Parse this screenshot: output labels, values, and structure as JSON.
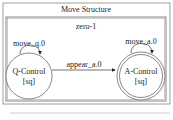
{
  "diagram": {
    "title": "Move Structure",
    "cluster": {
      "label": "zero-1"
    },
    "nodes": [
      {
        "id": "q",
        "label": "Q-Control",
        "sublabel": "[sq]",
        "shape": "circle"
      },
      {
        "id": "a",
        "label": "A-Control",
        "sublabel": "[sq]",
        "shape": "doublecircle"
      }
    ],
    "edges": [
      {
        "from": "q",
        "to": "q",
        "label": "move_q.0"
      },
      {
        "from": "a",
        "to": "a",
        "label": "move_a.0"
      },
      {
        "from": "q",
        "to": "a",
        "label": "appear_a.0"
      }
    ]
  }
}
